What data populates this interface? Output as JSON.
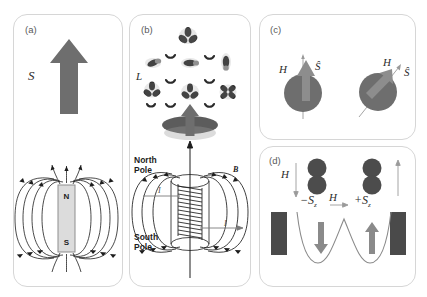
{
  "figure": {
    "background": "#ffffff",
    "panel_border_color": "#d6d6d6"
  },
  "panels": [
    {
      "id": "a",
      "label": "(a)",
      "caption_symbol": "S",
      "description": "Spin magnetic moment represented by a block arrow, and the equivalent bar magnet with dipole field lines",
      "magnet": {
        "north_label": "N",
        "south_label": "S",
        "body_color": "#dcdcdc"
      },
      "arrow_color": "#6e6e6e"
    },
    {
      "id": "b",
      "label": "(b)",
      "caption_symbol": "L",
      "description": "Orbital angular momentum of electron orbitals producing a magnetic moment, equivalent to a current-carrying solenoid",
      "north_pole_label": "North\nPole",
      "north_pole_line1": "North",
      "north_pole_line2": "Pole",
      "south_pole_line1": "South",
      "south_pole_line2": "Pole",
      "field_label": "B",
      "current_label": "I",
      "arrow_color": "#6e6e6e",
      "disc_color": "#5c5c5c"
    },
    {
      "id": "c",
      "label": "(c)",
      "description": "Two spheres showing spin S aligned parallel to applied field H (left) and canted at an angle to H (right)",
      "field_label": "H⃗",
      "spin_label": "Ŝ",
      "sphere_color": "#6e6e6e",
      "items": [
        {
          "name": "aligned-spin",
          "field_label": "H⃗",
          "spin_label": "Ŝ",
          "angle_deg": 0
        },
        {
          "name": "canted-spin",
          "field_label": "H⃗",
          "spin_label": "Ŝ",
          "angle_deg": 45
        }
      ]
    },
    {
      "id": "d",
      "label": "(d)",
      "description": "Double-well potential with two spin states minus Sz and plus Sz, field H reverses the favoured well",
      "field_label_left": "H⃗",
      "field_label_mid": "H⃗",
      "state_left": "−S",
      "state_left_sub": "z",
      "state_right": "+S",
      "state_right_sub": "z",
      "electrode_color": "#4a4a4a",
      "well_curve_color": "#8a8a8a",
      "arrow_color": "#8a8a8a",
      "sphere_color": "#4c4c4c"
    }
  ]
}
